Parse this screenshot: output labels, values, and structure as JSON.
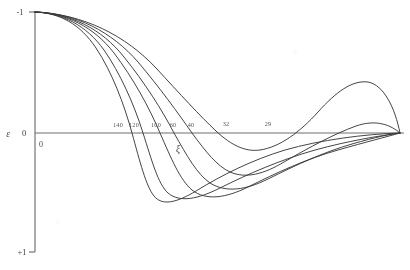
{
  "chart_data": {
    "type": "line",
    "title": "",
    "subtitle": "",
    "xlabel": "ξ",
    "ylabel": "ε",
    "xlim": [
      0,
      410
    ],
    "ylim": [
      -1,
      1
    ],
    "grid": false,
    "legend": "none",
    "axes": {
      "x_axis_y_pixel": 133,
      "y_axis_x_pixel": 35,
      "origin_label": "0",
      "y_ticks": [
        {
          "label": "-1",
          "value": -1
        },
        {
          "label": "0",
          "value": 0
        },
        {
          "label": "+1",
          "value": 1
        }
      ]
    },
    "annotations": [
      {
        "text": "140",
        "x": 118,
        "y": 127,
        "note": "zero crossing label"
      },
      {
        "text": "120",
        "x": 134,
        "y": 127,
        "note": "zero crossing label"
      },
      {
        "text": "100",
        "x": 156,
        "y": 127,
        "note": "zero crossing label"
      },
      {
        "text": "60",
        "x": 173,
        "y": 127,
        "note": "zero crossing label"
      },
      {
        "text": "40",
        "x": 191,
        "y": 127,
        "note": "zero crossing label"
      },
      {
        "text": "32",
        "x": 226,
        "y": 126,
        "note": "zero crossing label"
      },
      {
        "text": "29",
        "x": 268,
        "y": 126,
        "note": "zero crossing label"
      }
    ],
    "series": [
      {
        "name": "140",
        "zero_crossing": 140,
        "path": "M35,12 C60,13 80,24 96,48 C112,72 124,104 132,133 C140,162 146,186 154,196 C162,206 176,203 196,191 C222,175 252,160 285,150 C320,140 365,134 400,133"
      },
      {
        "name": "120",
        "zero_crossing": 120,
        "path": "M35,12 C62,13 86,25 104,50 C120,73 134,104 143,133 C152,161 158,184 168,193 C180,203 198,199 220,188 C248,174 280,160 315,150 C348,141 378,136 400,133"
      },
      {
        "name": "100",
        "zero_crossing": 100,
        "path": "M35,12 C66,13 94,27 114,53 C133,78 149,107 160,133 C171,158 180,180 192,190 C206,201 226,198 248,187 C276,173 306,159 338,150 C366,142 386,137 400,133"
      },
      {
        "name": "60",
        "zero_crossing": 60,
        "path": "M35,12 C70,13 102,29 124,57 C145,83 162,110 174,133 C187,156 197,174 210,183 C226,193 246,190 268,179 C296,165 324,152 352,144 C376,137 391,134 400,133"
      },
      {
        "name": "40",
        "zero_crossing": 40,
        "path": "M35,12 C76,13 112,32 138,62 C160,88 178,113 192,133 C206,152 217,166 230,172 C246,179 264,174 284,162 C310,147 334,134 356,126 C376,119 391,125 400,133"
      },
      {
        "name": "32",
        "zero_crossing": 32,
        "path": "M35,12 C84,14 126,36 156,68 C180,94 200,116 216,131 C232,146 246,152 260,150 C280,147 300,132 318,112 C336,92 352,80 368,82 C384,85 395,108 400,133"
      }
    ]
  },
  "labels": {
    "y_top": "-1",
    "y_zero": "0",
    "y_bottom": "+1",
    "y_axis_name": "ε",
    "x_axis_name": "ξ",
    "origin": "0"
  },
  "colors": {
    "curve": "#3a3a3a",
    "axis": "#6f6f6f",
    "text": "#4a4a4a",
    "background": "#ffffff"
  }
}
